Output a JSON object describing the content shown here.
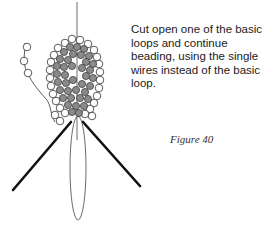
{
  "instruction": {
    "text": "Cut open one of the basic loops and continue beading, using the single wires instead of the basic loop."
  },
  "figure": {
    "label": "Figure 40",
    "illustration": "beaded-petal-on-wire",
    "colors": {
      "bead_outer": "#ffffff",
      "bead_inner": "#8a8a8a",
      "outline": "#333333",
      "wire_thick": "#111111"
    }
  }
}
